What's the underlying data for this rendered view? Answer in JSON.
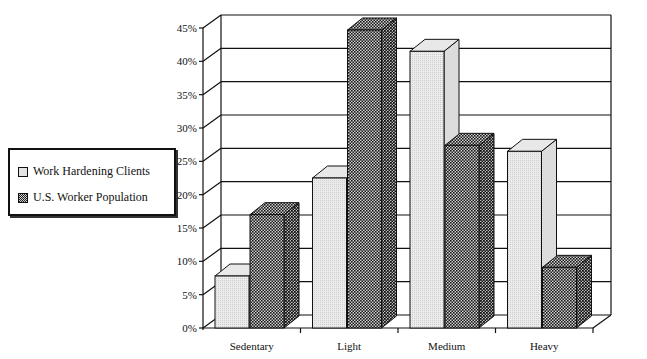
{
  "chart_data": {
    "type": "bar",
    "title": "",
    "xlabel": "",
    "ylabel": "",
    "categories": [
      "Sedentary",
      "Light",
      "Medium",
      "Heavy"
    ],
    "series": [
      {
        "name": "Work Hardening Clients",
        "values": [
          7.8,
          22.5,
          41.5,
          26.5
        ],
        "color": "#e3e3e3"
      },
      {
        "name": "U.S. Worker Population",
        "values": [
          17,
          44.7,
          27.4,
          9.1
        ],
        "color": "#444444"
      }
    ],
    "ylim": [
      0,
      45
    ],
    "yticks": [
      "0%",
      "5%",
      "10%",
      "15%",
      "20%",
      "25%",
      "30%",
      "35%",
      "40%",
      "45%"
    ],
    "grid": true,
    "style": "3d-clustered",
    "legend_position": "left"
  },
  "legend": {
    "items": [
      {
        "label": "Work Hardening Clients"
      },
      {
        "label": "U.S. Worker Population"
      }
    ]
  }
}
